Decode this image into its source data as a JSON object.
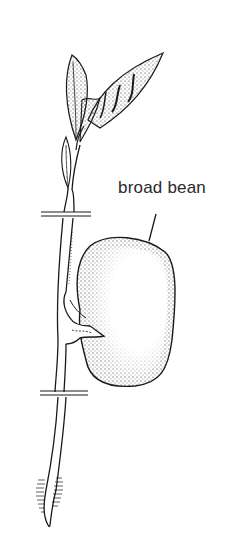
{
  "figure": {
    "labels": [
      {
        "id": "broad-bean",
        "text": "broad bean"
      }
    ],
    "colors": {
      "ink": "#1a1a1a",
      "label_text": "#2a2a2a",
      "background": "#ffffff"
    },
    "break_marks": 2
  }
}
